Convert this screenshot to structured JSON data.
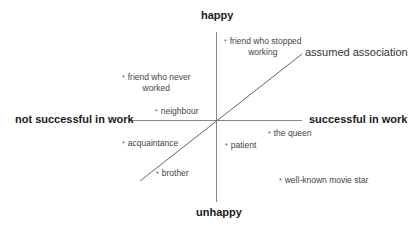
{
  "axes": {
    "top": "happy",
    "bottom": "unhappy",
    "left": "not successful in work",
    "right": "successful in work"
  },
  "line_label": "assumed association",
  "points": [
    {
      "id": "friend-stopped",
      "line1": "friend who stopped",
      "line2": "working"
    },
    {
      "id": "friend-never",
      "line1": "friend who never",
      "line2": "worked"
    },
    {
      "id": "neighbour",
      "line1": "neighbour"
    },
    {
      "id": "acquaintance",
      "line1": "acquaintance"
    },
    {
      "id": "brother",
      "line1": "brother"
    },
    {
      "id": "patient",
      "line1": "patient"
    },
    {
      "id": "queen",
      "line1": "the queen"
    },
    {
      "id": "movie-star",
      "line1": "well-known movie star"
    }
  ],
  "marker": "*",
  "colors": {
    "axis": "#888888",
    "line": "#555555",
    "text": "#222222"
  }
}
